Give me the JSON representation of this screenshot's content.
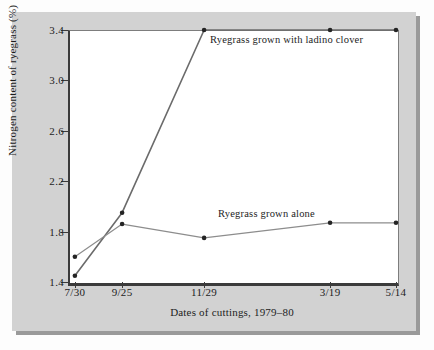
{
  "figure": {
    "background_color": "#d2d2d2",
    "plot_background_color": "#ffffff",
    "shadow_color": "#9a9a9a"
  },
  "chart_data": {
    "type": "line",
    "title": "",
    "xlabel": "Dates of cuttings, 1979–80",
    "ylabel": "Nitrogen content of ryegrass (%)",
    "categories": [
      "7/30",
      "9/25",
      "11/29",
      "3/19",
      "5/14"
    ],
    "x_positions_fraction": [
      0.021,
      0.165,
      0.415,
      0.799,
      1.0
    ],
    "xticks": [
      "7/30",
      "9/25",
      "11/29",
      "3/19",
      "5/14"
    ],
    "yticks": [
      1.4,
      1.8,
      2.2,
      2.6,
      3.0,
      3.4
    ],
    "ytick_labels": [
      "1.4",
      "1.8",
      "2.2",
      "2.6",
      "3.0",
      "3.4"
    ],
    "ylim": [
      1.4,
      3.4
    ],
    "grid": false,
    "legend_position": "inline-annotations",
    "series": [
      {
        "name": "Ryegrass grown with ladino clover",
        "color": "#6b6b6b",
        "marker": "dot",
        "values": [
          1.45,
          1.95,
          3.4,
          3.4,
          3.4
        ]
      },
      {
        "name": "Ryegrass grown alone",
        "color": "#8d8d8d",
        "marker": "dot",
        "values": [
          1.6,
          1.86,
          1.75,
          1.87,
          1.87
        ]
      }
    ],
    "annotations": [
      {
        "text": "Ryegrass grown with ladino clover",
        "series": "Ryegrass grown with ladino clover"
      },
      {
        "text": "Ryegrass grown alone",
        "series": "Ryegrass grown alone"
      }
    ]
  }
}
